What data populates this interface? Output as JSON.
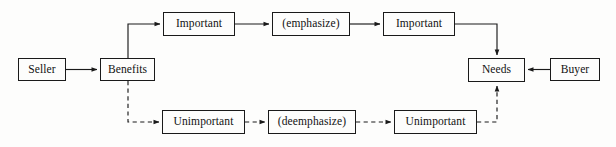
{
  "diagram": {
    "canvas": {
      "width": 616,
      "height": 147,
      "background": "#fdfdfc"
    },
    "style": {
      "node_fill": "#fdfdfc",
      "node_stroke": "#1a1a1a",
      "edge_stroke": "#1a1a1a",
      "text_color": "#111111"
    },
    "nodes": [
      {
        "id": "seller",
        "label": "Seller",
        "x": 18,
        "y": 58,
        "w": 48,
        "h": 23
      },
      {
        "id": "benefits",
        "label": "Benefits",
        "x": 100,
        "y": 58,
        "w": 55,
        "h": 23
      },
      {
        "id": "important1",
        "label": "Important",
        "x": 163,
        "y": 12,
        "w": 72,
        "h": 24
      },
      {
        "id": "emphasize",
        "label": "(emphasize)",
        "x": 272,
        "y": 12,
        "w": 78,
        "h": 24
      },
      {
        "id": "important2",
        "label": "Important",
        "x": 383,
        "y": 12,
        "w": 72,
        "h": 24
      },
      {
        "id": "needs",
        "label": "Needs",
        "x": 468,
        "y": 58,
        "w": 57,
        "h": 24
      },
      {
        "id": "buyer",
        "label": "Buyer",
        "x": 550,
        "y": 58,
        "w": 50,
        "h": 23
      },
      {
        "id": "unimportant1",
        "label": "Unimportant",
        "x": 162,
        "y": 110,
        "w": 83,
        "h": 24
      },
      {
        "id": "deemphasize",
        "label": "(deemphasize)",
        "x": 268,
        "y": 110,
        "w": 88,
        "h": 24
      },
      {
        "id": "unimportant2",
        "label": "Unimportant",
        "x": 394,
        "y": 110,
        "w": 83,
        "h": 24
      }
    ],
    "edges": [
      {
        "id": "seller-to-benefits",
        "from": "seller",
        "to": "benefits",
        "style": "solid",
        "path": "M66,69.5 L97,69.5"
      },
      {
        "id": "benefits-to-important1",
        "from": "benefits",
        "to": "important1",
        "style": "solid",
        "path": "M128,58 L128,24 L160,24"
      },
      {
        "id": "important1-to-emphasize",
        "from": "important1",
        "to": "emphasize",
        "style": "solid",
        "path": "M235,24 L269,24"
      },
      {
        "id": "emphasize-to-important2",
        "from": "emphasize",
        "to": "important2",
        "style": "solid",
        "path": "M350,24 L380,24"
      },
      {
        "id": "important2-to-needs",
        "from": "important2",
        "to": "needs",
        "style": "solid",
        "path": "M455,24 L497,24 L497,55"
      },
      {
        "id": "buyer-to-needs",
        "from": "buyer",
        "to": "needs",
        "style": "solid",
        "path": "M550,69.5 L528,69.5"
      },
      {
        "id": "benefits-to-unimportant1",
        "from": "benefits",
        "to": "unimportant1",
        "style": "dashed",
        "path": "M128,81 L128,122 L159,122"
      },
      {
        "id": "unimportant1-to-deemphasize",
        "from": "unimportant1",
        "to": "deemphasize",
        "style": "dashed",
        "path": "M245,122 L265,122"
      },
      {
        "id": "deemphasize-to-unimportant2",
        "from": "deemphasize",
        "to": "unimportant2",
        "style": "dashed",
        "path": "M356,122 L391,122"
      },
      {
        "id": "unimportant2-to-needs",
        "from": "unimportant2",
        "to": "needs",
        "style": "dashed",
        "path": "M477,122 L497,122 L497,86"
      }
    ]
  }
}
